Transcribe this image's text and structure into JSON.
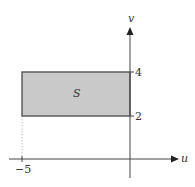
{
  "diagram": {
    "type": "region-in-uv-plane",
    "axes": {
      "horizontal_label": "u",
      "vertical_label": "v"
    },
    "region": {
      "label": "S",
      "u_range": [
        -5,
        0
      ],
      "v_range": [
        2,
        4
      ],
      "fill": "#c9c9c9",
      "stroke": "#555555"
    },
    "ticks": {
      "u": [
        {
          "value": -5,
          "label": "−5"
        }
      ],
      "v": [
        {
          "value": 2,
          "label": "2"
        },
        {
          "value": 4,
          "label": "4"
        }
      ]
    },
    "colors": {
      "axis": "#444444",
      "guide": "#aaaaaa"
    }
  }
}
